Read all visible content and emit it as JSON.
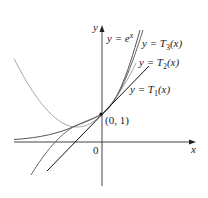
{
  "diagram": {
    "axes": {
      "x_label": "x",
      "y_label": "y",
      "origin_label": "0"
    },
    "point": {
      "label": "(0, 1)",
      "x": 0,
      "y": 1
    },
    "curves": [
      {
        "id": "exp",
        "label_prefix": "y = ",
        "label_main": "e",
        "label_sup": "x",
        "color": "#333333"
      },
      {
        "id": "T3",
        "label_prefix": "y = ",
        "label_main": "T",
        "label_sub": "3",
        "label_suffix": "(x)",
        "color": "#555555"
      },
      {
        "id": "T2",
        "label_prefix": "y = ",
        "label_main": "T",
        "label_sub": "2",
        "label_suffix": "(x)",
        "color": "#999999"
      },
      {
        "id": "T1",
        "label_prefix": "y = ",
        "label_main": "T",
        "label_sub": "1",
        "label_suffix": "(x)",
        "color": "#111111"
      }
    ]
  }
}
